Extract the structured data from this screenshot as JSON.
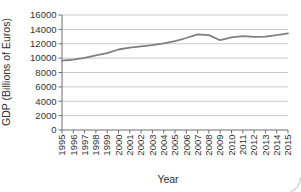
{
  "chart_data": {
    "type": "line",
    "title": "",
    "xlabel": "Year",
    "ylabel": "GDP (Billions of Euros)",
    "x": [
      1995,
      1996,
      1997,
      1998,
      1999,
      2000,
      2001,
      2002,
      2003,
      2004,
      2005,
      2006,
      2007,
      2008,
      2009,
      2010,
      2011,
      2012,
      2013,
      2014,
      2015
    ],
    "series": [
      {
        "name": "GDP",
        "values": [
          9650,
          9800,
          10050,
          10400,
          10700,
          11200,
          11450,
          11650,
          11800,
          12050,
          12350,
          12800,
          13300,
          13200,
          12500,
          12900,
          13050,
          12950,
          13000,
          13200,
          13450
        ]
      }
    ],
    "ylim": [
      0,
      16000
    ],
    "ytick_step": 2000,
    "grid": "horizontal",
    "legend": "none",
    "style": {
      "line_color": "#7f7f7f",
      "grid_color": "#c9c9c9",
      "axis_color": "#6e6e6e",
      "text_color": "#333333",
      "background": "#ffffff"
    }
  }
}
